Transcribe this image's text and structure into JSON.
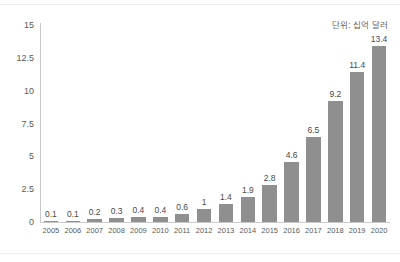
{
  "annotation": {
    "unit_note": "단위: 십억 달러"
  },
  "chart_data": {
    "type": "bar",
    "title": "",
    "subtitle": "",
    "xlabel": "",
    "ylabel": "",
    "categories": [
      "2005",
      "2006",
      "2007",
      "2008",
      "2009",
      "2010",
      "2011",
      "2012",
      "2013",
      "2014",
      "2015",
      "2016",
      "2017",
      "2018",
      "2019",
      "2020"
    ],
    "values": [
      0.1,
      0.1,
      0.2,
      0.3,
      0.4,
      0.4,
      0.6,
      1,
      1.4,
      1.9,
      2.8,
      4.6,
      6.5,
      9.2,
      11.4,
      13.4
    ],
    "value_labels": [
      "0.1",
      "0.1",
      "0.2",
      "0.3",
      "0.4",
      "0.4",
      "0.6",
      "1",
      "1.4",
      "1.9",
      "2.8",
      "4.6",
      "6.5",
      "9.2",
      "11.4",
      "13.4"
    ],
    "ylim": [
      0,
      15
    ],
    "yticks": [
      0,
      2.5,
      5,
      7.5,
      10,
      12.5,
      15
    ],
    "ytick_labels": [
      "0",
      "2.5",
      "5",
      "7.5",
      "10",
      "12.5",
      "15"
    ],
    "grid": false,
    "legend": false,
    "legend_position": "none",
    "annotations": [
      "단위: 십억 달러"
    ],
    "bar_color": "#8f8f8f",
    "axis_color": "#c9c9c9",
    "text_color": "#5a5a5a",
    "background_color": "#ffffff"
  }
}
